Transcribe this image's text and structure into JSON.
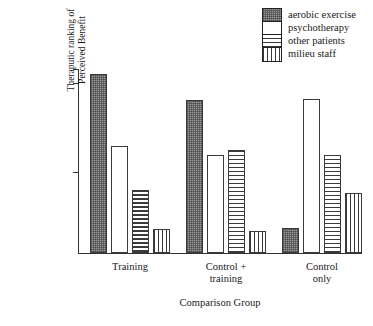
{
  "chart_data": {
    "type": "bar",
    "title": "",
    "xlabel": "Comparison Group",
    "ylabel": "Theraputic ranking of\nPerceived Benefit",
    "categories": [
      "Training",
      "Control +\ntraining",
      "Control\nonly"
    ],
    "series": [
      {
        "name": "aerobic exercise",
        "pattern": "pat-dot",
        "values": [
          97.3,
          83.2,
          13.6
        ]
      },
      {
        "name": "psychotherapy",
        "pattern": "pat-white",
        "values": [
          58.2,
          53.3,
          83.7
        ]
      },
      {
        "name": "other patients",
        "pattern": "pat-hline",
        "values": [
          34.2,
          56.0,
          53.3
        ]
      },
      {
        "name": "milieu staff",
        "pattern": "pat-vline",
        "values": [
          13.0,
          12.0,
          32.6
        ]
      }
    ],
    "ylim": [
      0,
      100
    ],
    "y_ticks": [
      100,
      92.4,
      44.0
    ],
    "y_tick_labels": [
      "",
      "",
      ""
    ],
    "grid": false,
    "legend_position": "top-right"
  },
  "legend": {
    "entries": [
      {
        "label": "aerobic exercise"
      },
      {
        "label": "psychotherapy"
      },
      {
        "label": "other patients"
      },
      {
        "label": "milieu staff"
      }
    ]
  },
  "axes": {
    "x_title": "Comparison Group",
    "y_title": "Theraputic ranking of\nPerceived Benefit"
  }
}
